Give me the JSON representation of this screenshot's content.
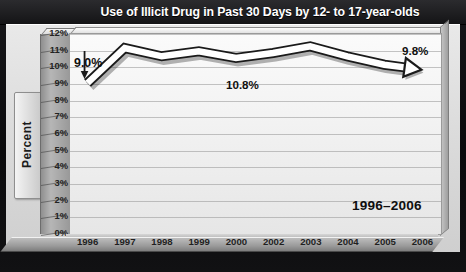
{
  "header": {
    "title": "Use of Illicit Drug in Past 30 Days by 12- to 17-year-olds"
  },
  "axis": {
    "y_title": "Percent",
    "y_ticks": [
      "12%",
      "11%",
      "10%",
      "9%",
      "8%",
      "7%",
      "6%",
      "5%",
      "4%",
      "3%",
      "2%",
      "1%",
      "0%"
    ],
    "x_ticks": [
      "1996",
      "1997",
      "1998",
      "1999",
      "2000",
      "2002",
      "2003",
      "2004",
      "2005",
      "2006"
    ]
  },
  "annotations": {
    "start_value": "9.0%",
    "mid_value": "10.8%",
    "end_value": "9.8%",
    "range_caption": "1996–2006"
  },
  "colors": {
    "title_bar": "#1b1b1e",
    "panel": "#e4e4e4",
    "plot": "#f5f5f5",
    "line_fill": "#ffffff",
    "line_stroke": "#1a1a1a",
    "grid": "#969696",
    "text": "#151515"
  },
  "chart_data": {
    "type": "line",
    "title": "Use of Illicit Drug in Past 30 Days by 12- to 17-year-olds",
    "subtitle": "1996–2006",
    "xlabel": "",
    "ylabel": "Percent",
    "x": [
      "1996",
      "1997",
      "1998",
      "1999",
      "2000",
      "2002",
      "2003",
      "2004",
      "2005",
      "2006"
    ],
    "categories": [
      "1996",
      "1997",
      "1998",
      "1999",
      "2000",
      "2002",
      "2003",
      "2004",
      "2005",
      "2006"
    ],
    "values": [
      9.0,
      11.1,
      10.6,
      10.9,
      10.5,
      10.8,
      11.2,
      10.6,
      10.1,
      9.8
    ],
    "series": [
      {
        "name": "Past 30 day illicit drug use, ages 12-17",
        "values": [
          9.0,
          11.1,
          10.6,
          10.9,
          10.5,
          10.8,
          11.2,
          10.6,
          10.1,
          9.8
        ]
      }
    ],
    "data_labels": [
      {
        "x": "1996",
        "value": 9.0,
        "text": "9.0%"
      },
      {
        "x": "2002",
        "value": 10.8,
        "text": "10.8%"
      },
      {
        "x": "2006",
        "value": 9.8,
        "text": "9.8%"
      }
    ],
    "ylim": [
      0,
      12
    ],
    "ytick_step": 1,
    "ytick_format": "percent",
    "grid": true,
    "legend": false,
    "style": "3d-ribbon-line-with-arrow-terminator",
    "note": "x axis tick labels omit 2001"
  }
}
